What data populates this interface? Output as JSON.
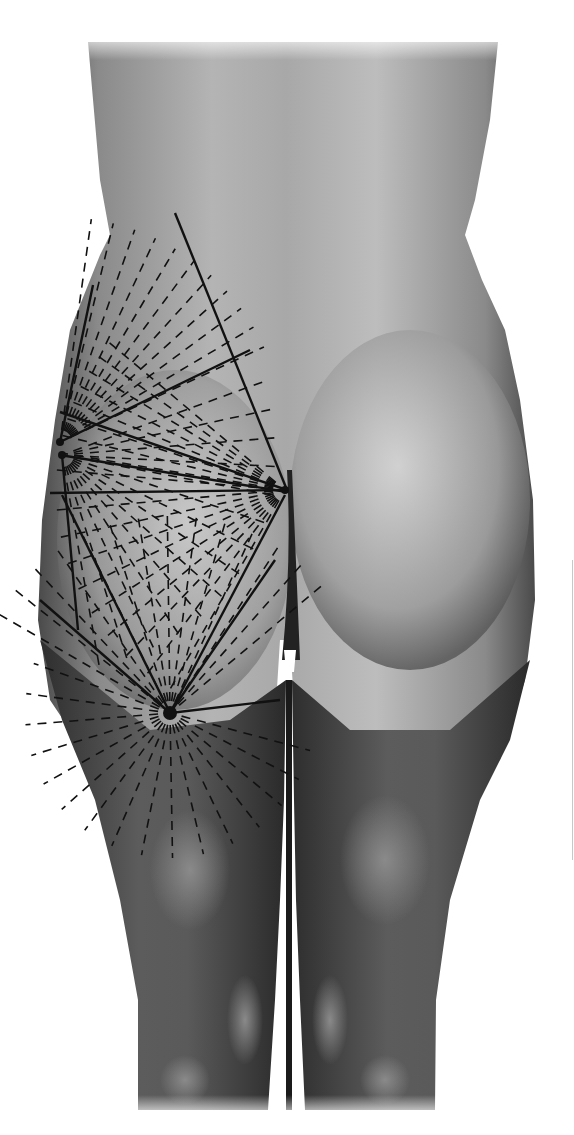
{
  "figure": {
    "annotations": "radial dashed-line fans and solid triangulation lines on left buttock and thigh",
    "colors": {
      "background": "#ffffff",
      "skin_light": "#c9c9c9",
      "skin_mid": "#8e8e8e",
      "skin_dark": "#3a3a3a",
      "line": "#111111"
    },
    "apexes": [
      {
        "id": "A",
        "x": 60,
        "y": 442
      },
      {
        "id": "B",
        "x": 285,
        "y": 490
      },
      {
        "id": "C",
        "x": 170,
        "y": 713
      },
      {
        "id": "D",
        "x": 62,
        "y": 455
      }
    ],
    "solid_lines": [
      [
        175,
        213,
        287,
        490
      ],
      [
        93,
        285,
        60,
        442
      ],
      [
        60,
        442,
        250,
        350
      ],
      [
        60,
        412,
        287,
        490
      ],
      [
        60,
        455,
        287,
        492
      ],
      [
        50,
        493,
        287,
        490
      ],
      [
        62,
        455,
        78,
        630
      ],
      [
        40,
        600,
        170,
        713
      ],
      [
        62,
        495,
        170,
        713
      ],
      [
        285,
        495,
        170,
        713
      ],
      [
        275,
        560,
        170,
        713
      ],
      [
        170,
        713,
        280,
        700
      ]
    ],
    "fans": [
      {
        "apex": "A",
        "from": -82,
        "to": -25,
        "rays": 11,
        "length": 225
      },
      {
        "apex": "B",
        "from": -140,
        "to": -175,
        "rays": 9,
        "length": 230
      },
      {
        "apex": "D",
        "from": -20,
        "to": 80,
        "rays": 14,
        "length": 220
      },
      {
        "apex": "B",
        "from": 175,
        "to": 120,
        "rays": 9,
        "length": 230
      },
      {
        "apex": "C",
        "from": -150,
        "to": -40,
        "rays": 14,
        "length": 200
      },
      {
        "apex": "C",
        "from": 15,
        "to": 200,
        "rays": 16,
        "length": 145
      }
    ]
  }
}
